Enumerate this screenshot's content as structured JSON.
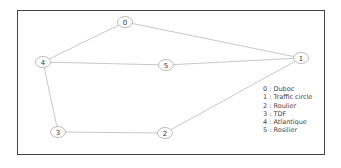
{
  "diagram": {
    "type": "graph",
    "nodes": [
      {
        "id": "0",
        "label": "0",
        "x": 125,
        "y": 22
      },
      {
        "id": "1",
        "label": "1",
        "x": 301,
        "y": 58
      },
      {
        "id": "2",
        "label": "2",
        "x": 165,
        "y": 133
      },
      {
        "id": "3",
        "label": "3",
        "x": 58,
        "y": 132
      },
      {
        "id": "4",
        "label": "4",
        "x": 43,
        "y": 62
      },
      {
        "id": "5",
        "label": "5",
        "x": 166,
        "y": 65
      }
    ],
    "edges": [
      {
        "from": "4",
        "to": "0"
      },
      {
        "from": "0",
        "to": "1"
      },
      {
        "from": "4",
        "to": "5"
      },
      {
        "from": "5",
        "to": "1"
      },
      {
        "from": "4",
        "to": "3"
      },
      {
        "from": "3",
        "to": "2"
      },
      {
        "from": "2",
        "to": "1"
      }
    ],
    "legend": [
      "0 : Duboc",
      "1 : Traffic  circle",
      "2 : Roulier",
      "3 : TDF",
      "4 : Atlantique",
      "5 : Rosilier"
    ]
  }
}
